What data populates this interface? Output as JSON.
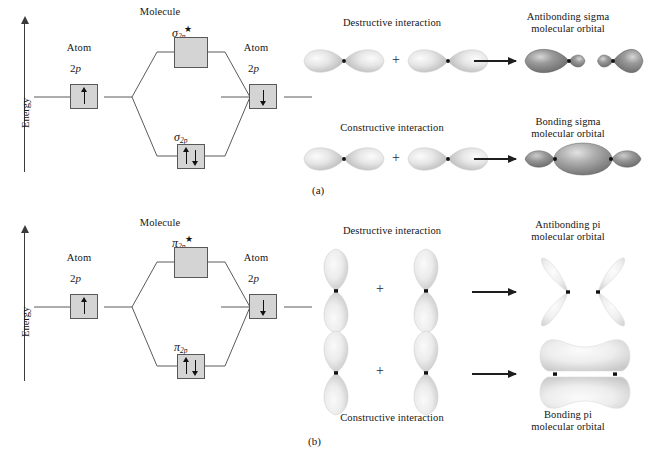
{
  "figure": {
    "panel_captions": {
      "a": "(a)",
      "b": "(b)"
    },
    "colors": {
      "box_fill": "#d4d4d4",
      "box_stroke": "#58585a",
      "line": "#3b3b3b",
      "arrow": "#1e1e1e",
      "lobe_light": "#e8e8e8",
      "lobe_mid": "#bdbdbd",
      "lobe_dark": "#8c8c8c",
      "lobe_darkest": "#6f6f6f",
      "text": "#161616"
    }
  },
  "panel_a": {
    "energy_axis_label": "Energy",
    "molecule_label": "Molecule",
    "left_atom": {
      "title": "Atom",
      "term": "2p",
      "spins": [
        "up"
      ]
    },
    "right_atom": {
      "title": "Atom",
      "term": "2p",
      "spins": [
        "down"
      ]
    },
    "antibonding_level": {
      "symbol": "σ",
      "subscript": "2p",
      "star": "★",
      "spins": []
    },
    "bonding_level": {
      "symbol": "σ",
      "subscript": "2p",
      "star": "",
      "spins": [
        "up",
        "down"
      ]
    },
    "rows": [
      {
        "interaction_label": "Destructive interaction",
        "result_label": "Antibonding sigma\nmolecular orbital",
        "plus_label": "+",
        "inputs": [
          "p-orbital-horizontal",
          "p-orbital-horizontal"
        ],
        "output": "antibonding-sigma-orbital"
      },
      {
        "interaction_label": "Constructive interaction",
        "result_label": "Bonding sigma\nmolecular orbital",
        "plus_label": "+",
        "inputs": [
          "p-orbital-horizontal",
          "p-orbital-horizontal"
        ],
        "output": "bonding-sigma-orbital"
      }
    ]
  },
  "panel_b": {
    "energy_axis_label": "Energy",
    "molecule_label": "Molecule",
    "left_atom": {
      "title": "Atom",
      "term": "2p",
      "spins": [
        "up"
      ]
    },
    "right_atom": {
      "title": "Atom",
      "term": "2p",
      "spins": [
        "down"
      ]
    },
    "antibonding_level": {
      "symbol": "π",
      "subscript": "2p",
      "star": "★",
      "spins": []
    },
    "bonding_level": {
      "symbol": "π",
      "subscript": "2p",
      "star": "",
      "spins": [
        "up",
        "down"
      ]
    },
    "rows": [
      {
        "interaction_label": "Destructive interaction",
        "result_label": "Antibonding pi\nmolecular orbital",
        "plus_label": "+",
        "inputs": [
          "p-orbital-vertical",
          "p-orbital-vertical"
        ],
        "output": "antibonding-pi-orbital"
      },
      {
        "interaction_label": "Constructive interaction",
        "result_label": "Bonding pi\nmolecular orbital",
        "plus_label": "+",
        "inputs": [
          "p-orbital-vertical",
          "p-orbital-vertical"
        ],
        "output": "bonding-pi-orbital"
      }
    ]
  }
}
